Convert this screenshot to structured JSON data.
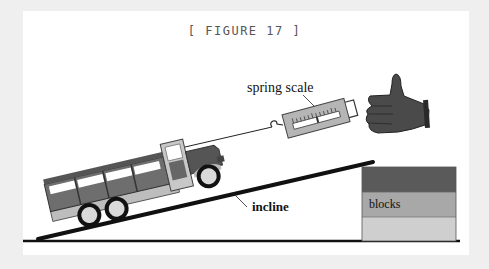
{
  "figure": {
    "title": "[ FIGURE 17 ]",
    "labels": {
      "spring_scale": "spring scale",
      "incline": "incline",
      "blocks": "blocks"
    },
    "colors": {
      "background": "#efefef",
      "panel": "#ffffff",
      "truck_dark": "#555555",
      "truck_mid": "#7a7a7a",
      "truck_light": "#c8c8c8",
      "scale_body": "#b5b5b5",
      "hand": "#4a4a4a",
      "block_top": "#5a5a5a",
      "block_mid": "#a8a8a8",
      "block_bottom": "#cfcfcf"
    },
    "elements": [
      "truck",
      "string",
      "spring-scale",
      "hand",
      "incline-ramp",
      "blocks-stack",
      "ground-line"
    ]
  }
}
